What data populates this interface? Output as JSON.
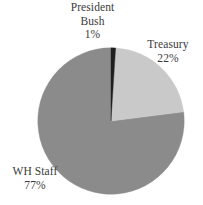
{
  "chart_data": {
    "type": "pie",
    "title": "",
    "subtitle": "",
    "xlabel": "",
    "ylabel": "",
    "legend_position": "none",
    "grid": false,
    "start_angle_deg": 0,
    "direction": "clockwise",
    "background": "#ffffff",
    "categories": [
      "President Bush",
      "Treasury",
      "WH Staff"
    ],
    "values": [
      1,
      22,
      77
    ],
    "value_unit": "percent",
    "colors": [
      "#1f1f1f",
      "#c9c9c9",
      "#8b8b8b"
    ],
    "slices": [
      {
        "name": "President Bush",
        "label_lines": [
          "President",
          "Bush"
        ],
        "value": 1,
        "value_label": "1%",
        "color": "#1f1f1f",
        "start_deg": 0,
        "end_deg": 3.6
      },
      {
        "name": "Treasury",
        "label_lines": [
          "Treasury"
        ],
        "value": 22,
        "value_label": "22%",
        "color": "#c9c9c9",
        "start_deg": 3.6,
        "end_deg": 82.8
      },
      {
        "name": "WH Staff",
        "label_lines": [
          "WH Staff"
        ],
        "value": 77,
        "value_label": "77%",
        "color": "#8b8b8b",
        "start_deg": 82.8,
        "end_deg": 360
      }
    ]
  },
  "labels": {
    "bush": {
      "line1": "President",
      "line2": "Bush",
      "percent": "1%"
    },
    "treasury": {
      "line1": "Treasury",
      "percent": "22%"
    },
    "whstaff": {
      "line1": "WH Staff",
      "percent": "77%"
    }
  },
  "geometry": {
    "center_x": 111,
    "center_y": 121,
    "radius": 74
  },
  "colors": {
    "background": "#ffffff",
    "text": "#3a3a3a",
    "slice_bush": "#1f1f1f",
    "slice_treasury": "#c9c9c9",
    "slice_whstaff": "#8b8b8b",
    "slice_outline": "#9a9a9a"
  }
}
